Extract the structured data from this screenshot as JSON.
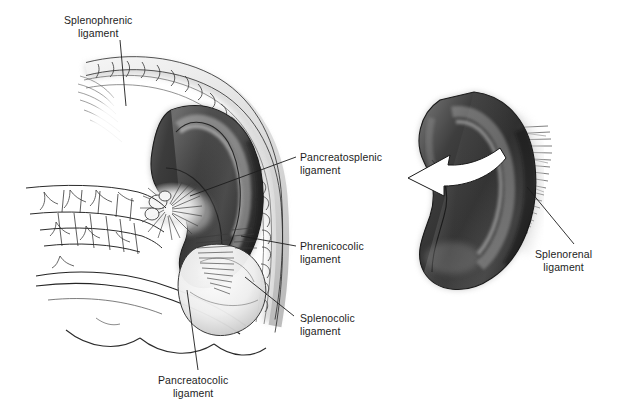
{
  "figure": {
    "background_color": "#ffffff",
    "ink_color": "#1d1d1d",
    "organ_dark": "#3a3a3a",
    "organ_mid": "#6f6f6f",
    "organ_light": "#c9c9c9",
    "width": 618,
    "height": 418
  },
  "labels": [
    {
      "name": "splenophrenic",
      "line1": "Splenophrenic",
      "line2": "ligament",
      "x": 64,
      "y": 14,
      "align": "center",
      "leader": {
        "x1": 120,
        "y1": 40,
        "x2": 126,
        "y2": 106
      }
    },
    {
      "name": "pancreatosplenic",
      "line1": "Pancreatosplenic",
      "line2": "ligament",
      "x": 300,
      "y": 151,
      "align": "left",
      "leader": {
        "x1": 296,
        "y1": 157,
        "x2": 190,
        "y2": 196
      }
    },
    {
      "name": "phrenicocolic",
      "line1": "Phrenicocolic",
      "line2": "ligament",
      "x": 300,
      "y": 240,
      "align": "left",
      "leader": {
        "x1": 296,
        "y1": 246,
        "x2": 241,
        "y2": 236
      }
    },
    {
      "name": "splenocolic",
      "line1": "Splenocolic",
      "line2": "ligament",
      "x": 300,
      "y": 312,
      "align": "left",
      "leader": {
        "x1": 294,
        "y1": 316,
        "x2": 245,
        "y2": 277
      }
    },
    {
      "name": "pancreatocolic",
      "line1": "Pancreatocolic",
      "line2": "ligament",
      "x": 158,
      "y": 374,
      "align": "center",
      "leader": {
        "x1": 198,
        "y1": 370,
        "x2": 187,
        "y2": 290
      }
    },
    {
      "name": "splenorenal",
      "line1": "Splenorenal",
      "line2": "ligament",
      "x": 535,
      "y": 248,
      "align": "left",
      "leader": {
        "x1": 574,
        "y1": 244,
        "x2": 527,
        "y2": 187
      }
    }
  ],
  "structures": {
    "left_panel": {
      "name": "spleen-in-situ-view",
      "parts": [
        "diaphragm",
        "spleen",
        "splenic-hilum",
        "pancreas-tail",
        "splenic-vessels",
        "transverse-colon",
        "splenic-flexure"
      ]
    },
    "right_panel": {
      "name": "isolated-spleen-view",
      "parts": [
        "spleen",
        "splenorenal-ligament-fibers",
        "rotation-arrow"
      ],
      "arrow": {
        "name": "rotation-arrow",
        "direction": "left-down",
        "fill": "#ffffff",
        "stroke": "#1d1d1d"
      }
    }
  }
}
